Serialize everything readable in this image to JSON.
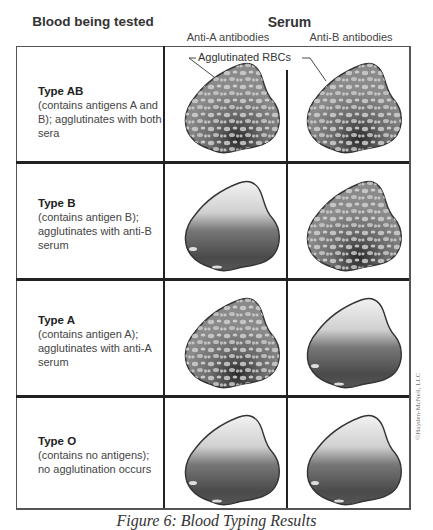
{
  "header": {
    "left_title": "Blood being tested",
    "serum_title": "Serum",
    "columns": [
      "Anti-A antibodies",
      "Anti-B antibodies"
    ]
  },
  "annotation": "Agglutinated RBCs",
  "rows": [
    {
      "type": "Type AB",
      "desc": "(contains antigens A and B); agglutinates with both sera",
      "anti_a": "agglutinated",
      "anti_b": "agglutinated"
    },
    {
      "type": "Type B",
      "desc": "(contains antigen B); agglutinates with anti-B serum",
      "anti_a": "smooth",
      "anti_b": "agglutinated"
    },
    {
      "type": "Type A",
      "desc": "(contains antigen A); agglutinates with anti-A serum",
      "anti_a": "agglutinated",
      "anti_b": "smooth"
    },
    {
      "type": "Type O",
      "desc": "(contains no antigens); no agglutination occurs",
      "anti_a": "smooth",
      "anti_b": "smooth"
    }
  ],
  "caption": "Figure 6: Blood Typing Results",
  "copyright": "©Hayden-McNeil, LLC",
  "colors": {
    "grid": "#222222",
    "blob_dark": "#3a3a3a",
    "blob_light": "#e8e8e8"
  }
}
